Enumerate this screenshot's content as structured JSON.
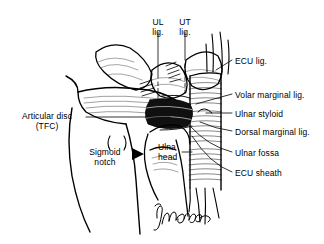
{
  "figure": {
    "type": "anatomical-line-drawing",
    "background_color": "#ffffff",
    "ink_color": "#000000",
    "signature": "Marlowe"
  },
  "labels": {
    "top": [
      {
        "id": "ul-lig",
        "line1": "UL",
        "line2": "lig."
      },
      {
        "id": "ut-lig",
        "line1": "UT",
        "line2": "lig."
      }
    ],
    "left": [
      {
        "id": "articular-disc",
        "line1": "Articular disc",
        "line2": "(TFC)"
      },
      {
        "id": "sigmoid-notch",
        "line1": "Sigmoid",
        "line2": "notch"
      }
    ],
    "center": [
      {
        "id": "ulna-head",
        "line1": "Ulna",
        "line2": "head"
      }
    ],
    "right": [
      {
        "id": "ecu-lig",
        "text": "ECU lig."
      },
      {
        "id": "volar-marginal-lig",
        "text": "Volar marginal lig."
      },
      {
        "id": "ulnar-styloid",
        "text": "Ulnar styloid"
      },
      {
        "id": "dorsal-marginal-lig",
        "text": "Dorsal marginal lig."
      },
      {
        "id": "ulnar-fossa",
        "text": "Ulnar fossa"
      },
      {
        "id": "ecu-sheath",
        "text": "ECU sheath"
      }
    ]
  }
}
